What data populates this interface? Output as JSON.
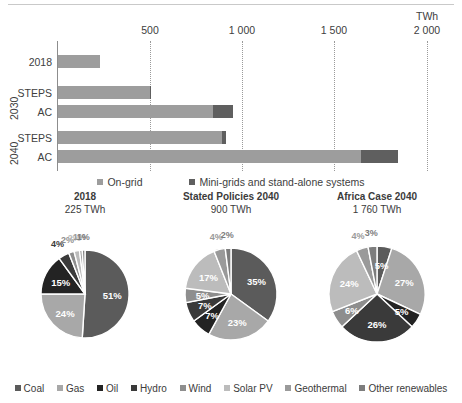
{
  "chart_data": [
    {
      "type": "bar",
      "orientation": "horizontal",
      "title": "",
      "unit_label": "TWh",
      "xlabel": "",
      "ylabel": "",
      "xlim": [
        0,
        2000
      ],
      "xticks": [
        500,
        1000,
        1500,
        2000
      ],
      "xtick_labels": [
        "500",
        "1 000",
        "1 500",
        "2 000"
      ],
      "grid": true,
      "legend_position": "bottom",
      "categories": [
        "2018",
        "STEPS",
        "AC",
        "STEPS",
        "AC"
      ],
      "groups": [
        {
          "label": "",
          "rows": [
            "2018"
          ]
        },
        {
          "label": "2030",
          "rows": [
            "STEPS",
            "AC"
          ]
        },
        {
          "label": "2040",
          "rows": [
            "STEPS",
            "AC"
          ]
        }
      ],
      "series": [
        {
          "name": "On-grid",
          "color": "#9d9d9d",
          "values": [
            225,
            495,
            835,
            880,
            1630
          ]
        },
        {
          "name": "Mini-grids and stand-alone systems",
          "color": "#5f5f5f",
          "values": [
            0,
            5,
            105,
            20,
            195
          ]
        }
      ]
    },
    {
      "type": "pie",
      "title": "2018",
      "subtitle": "225 TWh",
      "labels": [
        "Coal",
        "Gas",
        "Oil",
        "Hydro",
        "Wind",
        "Solar PV",
        "Geothermal",
        "Other renewables"
      ],
      "values": [
        51,
        24,
        15,
        4,
        2,
        2,
        1,
        1
      ],
      "value_labels": [
        "51%",
        "24%",
        "15%",
        "4%",
        "2%",
        "2%",
        "1%",
        "1%"
      ]
    },
    {
      "type": "pie",
      "title": "Stated Policies 2040",
      "subtitle": "900 TWh",
      "labels": [
        "Coal",
        "Gas",
        "Oil",
        "Hydro",
        "Wind",
        "Solar PV",
        "Geothermal",
        "Other renewables"
      ],
      "values": [
        35,
        23,
        7,
        7,
        5,
        17,
        4,
        2
      ],
      "value_labels": [
        "35%",
        "23%",
        "7%",
        "7%",
        "5%",
        "17%",
        "4%",
        "2%"
      ]
    },
    {
      "type": "pie",
      "title": "Africa Case 2040",
      "subtitle": "1 760 TWh",
      "labels": [
        "Coal",
        "Gas",
        "Oil",
        "Hydro",
        "Wind",
        "Solar PV",
        "Geothermal",
        "Other renewables"
      ],
      "values": [
        5,
        27,
        5,
        26,
        6,
        24,
        4,
        3
      ],
      "value_labels": [
        "5%",
        "27%",
        "5%",
        "26%",
        "6%",
        "24%",
        "4%",
        "3%"
      ]
    }
  ],
  "bar_chart": {
    "unit": "TWh",
    "ticks": [
      "500",
      "1 000",
      "1 500",
      "2 000"
    ],
    "rows": [
      {
        "cat": "2018"
      },
      {
        "cat": "STEPS"
      },
      {
        "cat": "AC"
      },
      {
        "cat": "STEPS"
      },
      {
        "cat": "AC"
      }
    ],
    "group_2030": "2030",
    "group_2040": "2040",
    "legend": [
      {
        "label": "On-grid",
        "color": "#9d9d9d"
      },
      {
        "label": "Mini-grids and stand-alone systems",
        "color": "#5f5f5f"
      }
    ]
  },
  "pies": [
    {
      "title": "2018",
      "subtitle": "225 TWh",
      "slices": [
        {
          "name": "Coal",
          "pct": 51,
          "label": "51%"
        },
        {
          "name": "Gas",
          "pct": 24,
          "label": "24%"
        },
        {
          "name": "Oil",
          "pct": 15,
          "label": "15%"
        },
        {
          "name": "Hydro",
          "pct": 4,
          "label": "4%"
        },
        {
          "name": "Wind",
          "pct": 2,
          "label": "2%"
        },
        {
          "name": "Solar PV",
          "pct": 2,
          "label": "2%"
        },
        {
          "name": "Geothermal",
          "pct": 1,
          "label": "1%"
        },
        {
          "name": "Other renewables",
          "pct": 1,
          "label": "1%"
        }
      ]
    },
    {
      "title": "Stated Policies 2040",
      "subtitle": "900 TWh",
      "slices": [
        {
          "name": "Coal",
          "pct": 35,
          "label": "35%"
        },
        {
          "name": "Gas",
          "pct": 23,
          "label": "23%"
        },
        {
          "name": "Oil",
          "pct": 7,
          "label": "7%"
        },
        {
          "name": "Hydro",
          "pct": 7,
          "label": "7%"
        },
        {
          "name": "Wind",
          "pct": 5,
          "label": "5%"
        },
        {
          "name": "Solar PV",
          "pct": 17,
          "label": "17%"
        },
        {
          "name": "Geothermal",
          "pct": 4,
          "label": "4%"
        },
        {
          "name": "Other renewables",
          "pct": 2,
          "label": "2%"
        }
      ]
    },
    {
      "title": "Africa Case 2040",
      "subtitle": "1 760 TWh",
      "slices": [
        {
          "name": "Coal",
          "pct": 5,
          "label": "5%"
        },
        {
          "name": "Gas",
          "pct": 27,
          "label": "27%"
        },
        {
          "name": "Oil",
          "pct": 5,
          "label": "5%"
        },
        {
          "name": "Hydro",
          "pct": 26,
          "label": "26%"
        },
        {
          "name": "Wind",
          "pct": 6,
          "label": "6%"
        },
        {
          "name": "Solar PV",
          "pct": 24,
          "label": "24%"
        },
        {
          "name": "Geothermal",
          "pct": 4,
          "label": "4%"
        },
        {
          "name": "Other renewables",
          "pct": 3,
          "label": "3%"
        }
      ]
    }
  ],
  "legend": [
    {
      "label": "Coal",
      "color": "#5b5b5b"
    },
    {
      "label": "Gas",
      "color": "#a8a8a8"
    },
    {
      "label": "Oil",
      "color": "#232323"
    },
    {
      "label": "Hydro",
      "color": "#3a3a3a"
    },
    {
      "label": "Wind",
      "color": "#8e8e8e"
    },
    {
      "label": "Solar PV",
      "color": "#bcbcbc"
    },
    {
      "label": "Geothermal",
      "color": "#9a9a9a"
    },
    {
      "label": "Other renewables",
      "color": "#7d7d7d"
    }
  ],
  "palette": {
    "coal": "#5b5b5b",
    "gas": "#a8a8a8",
    "oil": "#232323",
    "hydro": "#3a3a3a",
    "wind": "#8e8e8e",
    "solar": "#bcbcbc",
    "geothermal": "#9a9a9a",
    "other": "#7d7d7d",
    "ongrid": "#9d9d9d",
    "minigrid": "#5f5f5f"
  }
}
